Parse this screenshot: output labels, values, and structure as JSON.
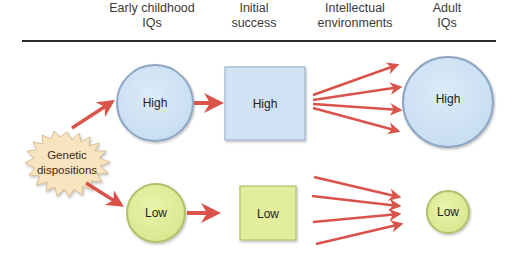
{
  "headers": [
    {
      "line1": "Early childhood",
      "line2": "IQs",
      "x": 152
    },
    {
      "line1": "Initial",
      "line2": "success",
      "x": 254
    },
    {
      "line1": "Intellectual",
      "line2": "environments",
      "x": 355
    },
    {
      "line1": "Adult",
      "line2": "IQs",
      "x": 447
    }
  ],
  "source": {
    "line1": "Genetic",
    "line2": "dispositions"
  },
  "high_row": {
    "early_iq": "High",
    "initial_success": "High",
    "adult_iq": "High"
  },
  "low_row": {
    "early_iq": "Low",
    "initial_success": "Low",
    "adult_iq": "Low"
  },
  "colors": {
    "high_fill": "#cfe3f5",
    "high_stroke": "#8ea6c4",
    "low_fill": "#e3ee9c",
    "low_stroke": "#b3bf6a",
    "burst_fill": "#f8e4bf",
    "arrow": "#d9534a"
  }
}
